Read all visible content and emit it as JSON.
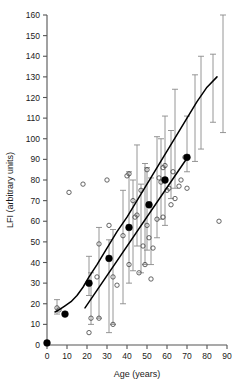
{
  "chart_data": {
    "type": "scatter",
    "title": "",
    "subtitle": "",
    "xlabel": "Age (years)",
    "ylabel": "LFI (arbitrary units)",
    "xlim": [
      0,
      90
    ],
    "ylim": [
      0,
      160
    ],
    "xticks": [
      0,
      10,
      20,
      30,
      40,
      50,
      60,
      70,
      80,
      90
    ],
    "yticks": [
      0,
      10,
      20,
      30,
      40,
      50,
      60,
      70,
      80,
      90,
      100,
      110,
      120,
      130,
      140,
      150,
      160
    ],
    "grid": false,
    "legend": "none",
    "axis_color": "#555555",
    "point_color": "#000000",
    "errorbar_color": "#8a8a8a",
    "trendline_color": "#000000",
    "annotations": [],
    "series": [
      {
        "name": "Group mean (filled circles)",
        "marker": "filled-circle",
        "x": [
          0,
          9,
          21,
          31,
          41,
          51,
          59,
          70
        ],
        "values": [
          1,
          15,
          30,
          42,
          57,
          68,
          80,
          91
        ]
      },
      {
        "name": "Individual subjects (open circles)",
        "marker": "open-circle",
        "x": [
          5,
          6,
          11,
          18,
          21,
          22,
          25,
          26,
          26,
          30,
          31,
          33,
          33,
          35,
          38,
          40,
          41,
          41,
          43,
          44,
          45,
          46,
          47,
          48,
          49,
          50,
          50,
          51,
          52,
          53,
          55,
          56,
          57,
          58,
          58,
          59,
          60,
          61,
          62,
          63,
          64,
          66,
          67,
          69,
          70,
          86
        ],
        "values": [
          18,
          17,
          74,
          78,
          6,
          13,
          33,
          49,
          13,
          80,
          58,
          10,
          33,
          29,
          53,
          82,
          83,
          39,
          70,
          62,
          63,
          35,
          75,
          48,
          39,
          85,
          58,
          52,
          32,
          47,
          61,
          81,
          79,
          86,
          62,
          87,
          75,
          76,
          68,
          84,
          71,
          77,
          80,
          91,
          76,
          60
        ]
      }
    ],
    "errorbars": [
      {
        "x": 5,
        "low": 15,
        "high": 22
      },
      {
        "x": 21,
        "low": 24,
        "high": 43
      },
      {
        "x": 22,
        "low": 10,
        "high": 35
      },
      {
        "x": 26,
        "low": 13,
        "high": 57
      },
      {
        "x": 31,
        "low": 6,
        "high": 51
      },
      {
        "x": 33,
        "low": 10,
        "high": 56
      },
      {
        "x": 38,
        "low": 20,
        "high": 75
      },
      {
        "x": 41,
        "low": 30,
        "high": 84
      },
      {
        "x": 43,
        "low": 36,
        "high": 80
      },
      {
        "x": 45,
        "low": 48,
        "high": 97
      },
      {
        "x": 47,
        "low": 35,
        "high": 78
      },
      {
        "x": 49,
        "low": 39,
        "high": 88
      },
      {
        "x": 50,
        "low": 46,
        "high": 86
      },
      {
        "x": 52,
        "low": 39,
        "high": 81
      },
      {
        "x": 55,
        "low": 52,
        "high": 101
      },
      {
        "x": 57,
        "low": 61,
        "high": 100
      },
      {
        "x": 59,
        "low": 58,
        "high": 111
      },
      {
        "x": 62,
        "low": 71,
        "high": 104
      },
      {
        "x": 64,
        "low": 76,
        "high": 124
      },
      {
        "x": 70,
        "low": 84,
        "high": 111
      },
      {
        "x": 74,
        "low": 89,
        "high": 131
      },
      {
        "x": 77,
        "low": 95,
        "high": 140
      },
      {
        "x": 83,
        "low": 108,
        "high": 141
      },
      {
        "x": 88,
        "low": 103,
        "high": 160
      }
    ],
    "trendlines": [
      {
        "name": "Upper fitted curve",
        "type": "curve",
        "points": [
          [
            4,
            16
          ],
          [
            6,
            17
          ],
          [
            9,
            19
          ],
          [
            12,
            21
          ],
          [
            15,
            24
          ],
          [
            18,
            28
          ],
          [
            21,
            33
          ],
          [
            25,
            39
          ],
          [
            30,
            47
          ],
          [
            35,
            55
          ],
          [
            40,
            62
          ],
          [
            45,
            70
          ],
          [
            50,
            78
          ],
          [
            55,
            86
          ],
          [
            60,
            94
          ],
          [
            65,
            102
          ],
          [
            70,
            110
          ],
          [
            75,
            118
          ],
          [
            80,
            125
          ],
          [
            85,
            130
          ]
        ]
      },
      {
        "name": "Lower fitted line",
        "type": "line",
        "points": [
          [
            19,
            18
          ],
          [
            71,
            92
          ]
        ]
      }
    ]
  }
}
